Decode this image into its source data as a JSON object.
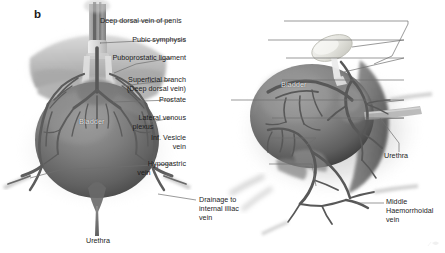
{
  "figure": {
    "panel_letter": "b",
    "background_color": "#ffffff",
    "label_color": "#1d1d1d",
    "leader_line_color": "#6f6f6f",
    "organ_label_color": "#e9e9e9"
  },
  "callouts": [
    {
      "id": "deep-dorsal-vein-of-penis",
      "text": "Deep dorsal vein of penis",
      "align": "right"
    },
    {
      "id": "pubic-symphysis",
      "text": "Pubic symphysis",
      "align": "right"
    },
    {
      "id": "puboprostatic-ligament",
      "text": "Puboprostatic ligament",
      "align": "right"
    },
    {
      "id": "superficial-branch",
      "text": "Superficial branch",
      "align": "right"
    },
    {
      "id": "deep-dorsal-vein-sub",
      "text": "(Deep dorsal vein)",
      "align": "right"
    },
    {
      "id": "prostate",
      "text": "Prostate",
      "align": "right"
    },
    {
      "id": "lateral-venous-plexus-line1",
      "text": "Lateral venous",
      "align": "right"
    },
    {
      "id": "lateral-venous-plexus-line2",
      "text": "plexus",
      "align": "center"
    },
    {
      "id": "inf-vesicle-vein-line1",
      "text": "Inf. Vesicle",
      "align": "right"
    },
    {
      "id": "inf-vesicle-vein-line2",
      "text": "vein",
      "align": "right"
    },
    {
      "id": "hypogastric-vein-line1",
      "text": "Hypogastric",
      "align": "right"
    },
    {
      "id": "hypogastric-vein-line2",
      "text": "vein",
      "align": "center"
    },
    {
      "id": "drainage-internal-illiac-line1",
      "text": "Drainage to",
      "align": "left"
    },
    {
      "id": "drainage-internal-illiac-line2",
      "text": "internal illiac",
      "align": "left"
    },
    {
      "id": "drainage-internal-illiac-line3",
      "text": "vein",
      "align": "left"
    },
    {
      "id": "urethra-left",
      "text": "Urethra",
      "align": "center"
    },
    {
      "id": "urethra-right",
      "text": "Urethra",
      "align": "left"
    },
    {
      "id": "middle-haemorrhoidal-vein-line1",
      "text": "Middle",
      "align": "left"
    },
    {
      "id": "middle-haemorrhoidal-vein-line2",
      "text": "Haemorrhoidal",
      "align": "left"
    },
    {
      "id": "middle-haemorrhoidal-vein-line3",
      "text": "vein",
      "align": "left"
    }
  ],
  "organ_labels": [
    {
      "id": "bladder-left",
      "text": "Bladder"
    },
    {
      "id": "bladder-right",
      "text": "Bladder"
    }
  ]
}
